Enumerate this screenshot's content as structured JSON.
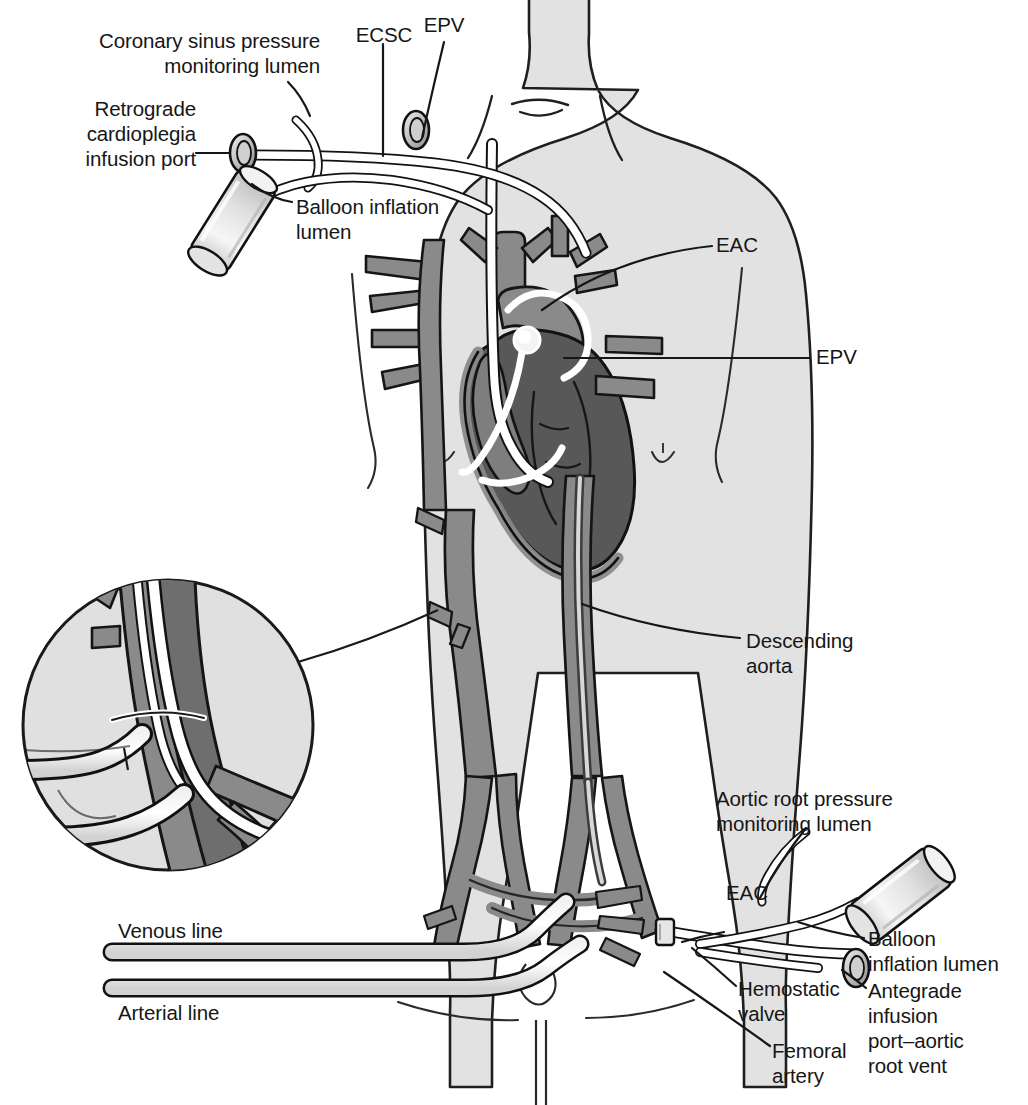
{
  "figure": {
    "type": "medical-illustration",
    "palette": {
      "background": "#ffffff",
      "body_fill": "#e0e0e0",
      "body_outline": "#1a1a1a",
      "vessel_mid": "#8a8a8a",
      "vessel_dark": "#6e6e6e",
      "heart_dark": "#585858",
      "catheter_white": "#ffffff",
      "catheter_outline": "#111111",
      "cannula_fill": "#ebebeb",
      "text": "#161616"
    }
  },
  "labels": {
    "coronary_sinus": "Coronary sinus pressure\nmonitoring lumen",
    "retrograde_port": "Retrograde\ncardioplegia\ninfusion port",
    "balloon_inflation_top": "Balloon inflation\nlumen",
    "ecsc": "ECSC",
    "epv_top": "EPV",
    "eac_top": "EAC",
    "epv_right": "EPV",
    "descending_aorta": "Descending\naorta",
    "aortic_root": "Aortic root pressure\nmonitoring lumen",
    "eac_bottom": "EAC",
    "balloon_inflation_bottom": "Balloon\ninflation lumen",
    "hemostatic_valve": "Hemostatic\nvalve",
    "antegrade_port": "Antegrade\ninfusion\nport–aortic\nroot vent",
    "femoral_artery": "Femoral\nartery",
    "venous_line": "Venous line",
    "arterial_line": "Arterial line"
  },
  "abbreviations": [
    {
      "code": "ECSC",
      "meaning": "Endocoronary sinus catheter"
    },
    {
      "code": "EPV",
      "meaning": "Endopulmonary vent"
    },
    {
      "code": "EAC",
      "meaning": "Endoaortic clamp"
    }
  ],
  "components": [
    {
      "name": "retrograde-cardioplegia-infusion-port",
      "kind": "port"
    },
    {
      "name": "coronary-sinus-pressure-monitoring-lumen",
      "kind": "lumen"
    },
    {
      "name": "balloon-inflation-lumen-superior",
      "kind": "lumen"
    },
    {
      "name": "balloon-inflation-syringe-superior",
      "kind": "syringe"
    },
    {
      "name": "endopulmonary-vent-port",
      "kind": "port"
    },
    {
      "name": "endocoronary-sinus-catheter",
      "kind": "catheter"
    },
    {
      "name": "endoaortic-clamp-balloon",
      "kind": "balloon"
    },
    {
      "name": "aortic-root-pressure-monitoring-lumen",
      "kind": "lumen"
    },
    {
      "name": "balloon-inflation-syringe-inferior",
      "kind": "syringe"
    },
    {
      "name": "antegrade-infusion-port-aortic-root-vent",
      "kind": "port"
    },
    {
      "name": "hemostatic-valve",
      "kind": "valve"
    },
    {
      "name": "venous-return-cannula",
      "kind": "cannula"
    },
    {
      "name": "arterial-return-cannula",
      "kind": "cannula"
    },
    {
      "name": "femoral-artery",
      "kind": "vessel"
    },
    {
      "name": "descending-aorta",
      "kind": "vessel"
    },
    {
      "name": "magnified-inset-femoral-access",
      "kind": "inset"
    }
  ]
}
